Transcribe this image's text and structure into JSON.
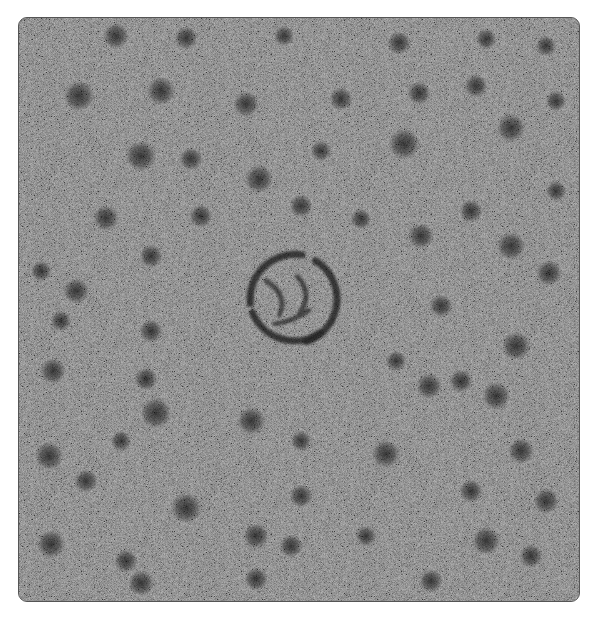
{
  "image": {
    "description": "Grayscale noisy micrograph with scattered dark blobs and a central spiral ring",
    "background_gray": "#7a7a7a",
    "blob_color": "#2a2a2a",
    "blobs": [
      [
        115,
        35,
        10
      ],
      [
        185,
        37,
        9
      ],
      [
        283,
        35,
        8
      ],
      [
        398,
        42,
        9
      ],
      [
        485,
        38,
        8
      ],
      [
        545,
        45,
        8
      ],
      [
        78,
        95,
        12
      ],
      [
        160,
        90,
        11
      ],
      [
        245,
        103,
        10
      ],
      [
        340,
        98,
        9
      ],
      [
        418,
        92,
        9
      ],
      [
        475,
        85,
        9
      ],
      [
        555,
        100,
        8
      ],
      [
        140,
        155,
        12
      ],
      [
        258,
        178,
        11
      ],
      [
        403,
        143,
        12
      ],
      [
        510,
        127,
        11
      ],
      [
        190,
        158,
        9
      ],
      [
        320,
        150,
        8
      ],
      [
        105,
        217,
        10
      ],
      [
        200,
        215,
        9
      ],
      [
        300,
        205,
        9
      ],
      [
        360,
        218,
        8
      ],
      [
        470,
        210,
        9
      ],
      [
        555,
        190,
        8
      ],
      [
        75,
        290,
        10
      ],
      [
        150,
        255,
        9
      ],
      [
        420,
        235,
        10
      ],
      [
        510,
        245,
        11
      ],
      [
        548,
        272,
        10
      ],
      [
        40,
        270,
        8
      ],
      [
        150,
        330,
        9
      ],
      [
        60,
        320,
        8
      ],
      [
        515,
        345,
        11
      ],
      [
        440,
        305,
        9
      ],
      [
        395,
        360,
        8
      ],
      [
        52,
        370,
        10
      ],
      [
        145,
        378,
        9
      ],
      [
        250,
        420,
        11
      ],
      [
        155,
        412,
        12
      ],
      [
        428,
        385,
        10
      ],
      [
        495,
        395,
        11
      ],
      [
        460,
        380,
        9
      ],
      [
        48,
        455,
        11
      ],
      [
        120,
        440,
        8
      ],
      [
        385,
        453,
        11
      ],
      [
        520,
        450,
        10
      ],
      [
        300,
        440,
        8
      ],
      [
        85,
        480,
        9
      ],
      [
        185,
        507,
        12
      ],
      [
        300,
        495,
        9
      ],
      [
        470,
        490,
        9
      ],
      [
        545,
        500,
        10
      ],
      [
        50,
        543,
        11
      ],
      [
        125,
        560,
        9
      ],
      [
        255,
        535,
        10
      ],
      [
        290,
        545,
        9
      ],
      [
        365,
        535,
        8
      ],
      [
        485,
        540,
        11
      ],
      [
        530,
        555,
        9
      ],
      [
        140,
        582,
        10
      ],
      [
        255,
        578,
        9
      ],
      [
        430,
        580,
        9
      ]
    ],
    "spiral": {
      "cx": 292,
      "cy": 298,
      "r": 45
    }
  }
}
